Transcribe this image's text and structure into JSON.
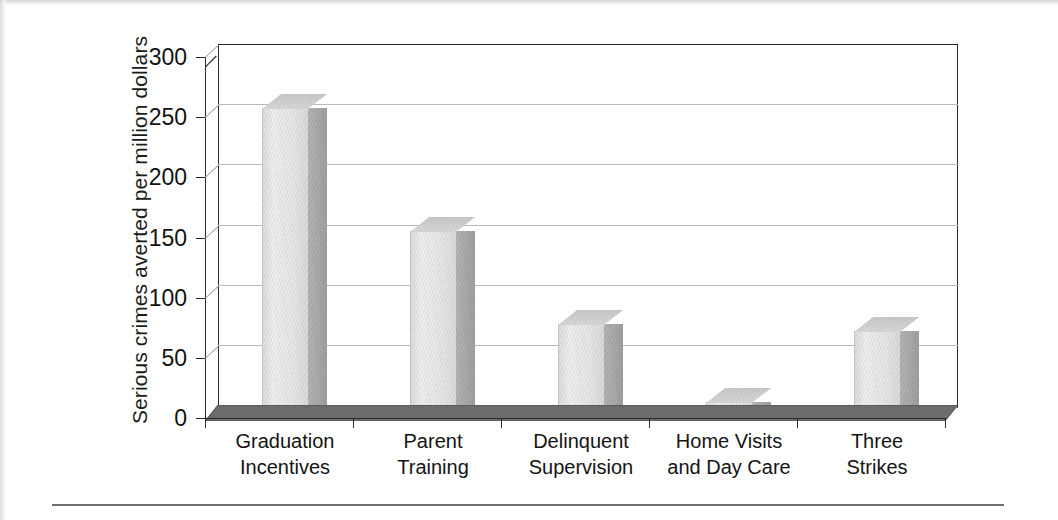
{
  "figure": {
    "ylabel": "Serious crimes averted per million dollars"
  },
  "chart_data": {
    "type": "bar",
    "title": "",
    "xlabel": "",
    "ylabel": "Serious crimes averted per million dollars",
    "categories": [
      "Graduation\nIncentives",
      "Parent\nTraining",
      "Delinquent\nSupervision",
      "Home Visits\nand Day Care",
      "Three\nStrikes"
    ],
    "category_lines": [
      [
        "Graduation",
        "Incentives"
      ],
      [
        "Parent",
        "Training"
      ],
      [
        "Delinquent",
        "Supervision"
      ],
      [
        "Home Visits",
        "and Day Care"
      ],
      [
        "Three",
        "Strikes"
      ]
    ],
    "values": [
      258,
      155,
      78,
      13,
      72
    ],
    "ylim": [
      0,
      300
    ],
    "yticks": [
      0,
      50,
      100,
      150,
      200,
      250,
      300
    ],
    "ytick_labels": [
      "0",
      "50",
      "100",
      "150",
      "200",
      "250",
      "300"
    ],
    "grid": true,
    "legend": false,
    "style": "3d-column",
    "colors": {
      "bar_face": "#e4e4e4",
      "bar_side": "#a8a8a8",
      "bar_top": "#d2d2d2",
      "floor": "#6c6c6c",
      "axis": "#2a2a2a",
      "gridline": "#b9b9b9",
      "text": "#141414",
      "background": "#ffffff"
    }
  }
}
